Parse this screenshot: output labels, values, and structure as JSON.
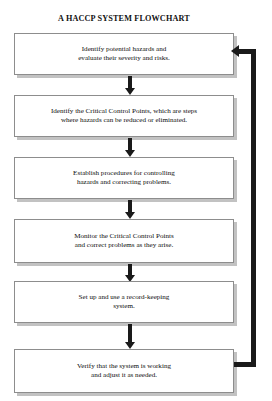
{
  "diagram": {
    "title": "A HACCP SYSTEM FLOWCHART",
    "type": "flowchart",
    "orientation": "vertical",
    "steps": [
      {
        "index": 1,
        "text": "Identify potential hazards and\nevaluate their severity and risks."
      },
      {
        "index": 2,
        "text": "Identify the Critical Control Points, which are steps\nwhere hazards can be reduced or eliminated."
      },
      {
        "index": 3,
        "text": "Establish procedures for controlling\nhazards and correcting problems."
      },
      {
        "index": 4,
        "text": "Monitor the Critical Control Points\nand correct problems as they arise."
      },
      {
        "index": 5,
        "text": "Set up and use a record-keeping\nsystem."
      },
      {
        "index": 6,
        "text": "Verify that the system is working\nand adjust it as needed."
      }
    ],
    "connectors": {
      "down_arrow_count": 5,
      "feedback_loop": {
        "from_step": 6,
        "to_step": 1,
        "direction": "up-left"
      }
    },
    "colors": {
      "background": "#ffffff",
      "box_fill": "#ffffff",
      "box_border": "#8d8d8d",
      "box_shadow": "#c2c2c2",
      "arrow": "#1a1a1a",
      "text": "#0d0d0d"
    }
  }
}
